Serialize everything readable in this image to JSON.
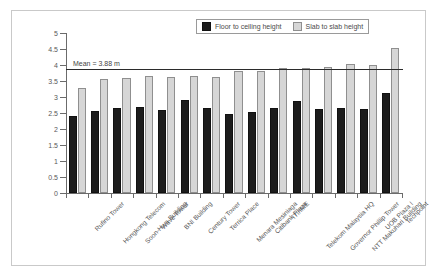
{
  "chart_data": {
    "type": "bar",
    "title": "",
    "subtitle": "",
    "xlabel": "",
    "ylabel": "Height (m)",
    "ylim": [
      0,
      5
    ],
    "ytick_labels": [
      "0",
      "0.5",
      "1",
      "1.5",
      "2",
      "2.5",
      "3",
      "3.5",
      "4",
      "4.5",
      "5"
    ],
    "ytick_values": [
      0,
      0.5,
      1,
      1.5,
      2,
      2.5,
      3,
      3.5,
      4,
      4.5,
      5
    ],
    "grid": false,
    "legend_position": "top-right",
    "categories": [
      "Rufino Tower",
      "Hongkong Telecom",
      "Soon-Hwa Building",
      "Wave Tower",
      "BNI Building",
      "Century Tower",
      "Terrica Place",
      "Menara Mesiniaga",
      "Citibank Plaza",
      "ITI/IME",
      "Telekom Malaysia HQ",
      "Governor Phillip Tower",
      "NTT Makuhari Building",
      "UOB Plaza I",
      "Techpoint"
    ],
    "series": [
      {
        "name": "Floor to ceiling height",
        "color": "#1c1c1c",
        "values": [
          2.4,
          2.55,
          2.67,
          2.69,
          2.58,
          2.92,
          2.65,
          2.46,
          2.53,
          2.65,
          2.86,
          2.61,
          2.65,
          2.63,
          3.12
        ]
      },
      {
        "name": "Slab to slab height",
        "color": "#d6d6d6",
        "values": [
          3.28,
          3.55,
          3.58,
          3.66,
          3.63,
          3.65,
          3.62,
          3.8,
          3.82,
          3.91,
          3.92,
          3.93,
          4.02,
          4.01,
          4.52
        ]
      }
    ],
    "annotations": [
      {
        "name": "mean-reference-line",
        "label": "Mean = 3.88 m",
        "value": 3.88,
        "orientation": "horizontal",
        "color": "#2b2b2b"
      }
    ]
  }
}
